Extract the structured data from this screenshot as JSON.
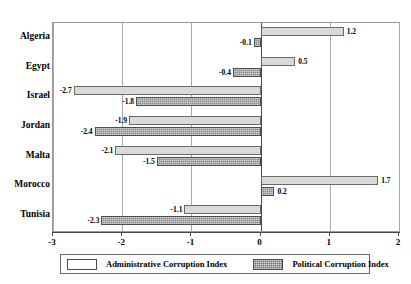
{
  "chart_data": {
    "type": "bar",
    "orientation": "horizontal",
    "title": "",
    "xlabel": "",
    "ylabel": "",
    "xlim": [
      -3,
      2
    ],
    "xticks": [
      "-3",
      "-2",
      "-1",
      "0",
      "1",
      "2"
    ],
    "grid": true,
    "legend_position": "bottom",
    "categories": [
      "Algeria",
      "Egypt",
      "Israel",
      "Jordan",
      "Malta",
      "Morocco",
      "Tunisia"
    ],
    "series": [
      {
        "name": "Administrative Corruption Index",
        "color": "#d9d9d9",
        "values": [
          1.2,
          0.5,
          -2.7,
          -1.9,
          -2.1,
          1.7,
          -1.1
        ],
        "labels": [
          "1.2",
          "0.5",
          "-2.7",
          "-1.9",
          "-2.1",
          "1.7",
          "-1.1"
        ]
      },
      {
        "name": "Political Corruption Index",
        "color": "#8a8a8a",
        "values": [
          -0.1,
          -0.4,
          -1.8,
          -2.4,
          -1.5,
          0.2,
          -2.3
        ],
        "labels": [
          "-0.1",
          "-0.4",
          "-1.8",
          "-2.4",
          "-1.5",
          "0.2",
          "-2.3"
        ]
      }
    ]
  },
  "legend": {
    "entries": [
      {
        "label": "Administrative Corruption Index"
      },
      {
        "label": "Political Corruption Index"
      }
    ]
  }
}
